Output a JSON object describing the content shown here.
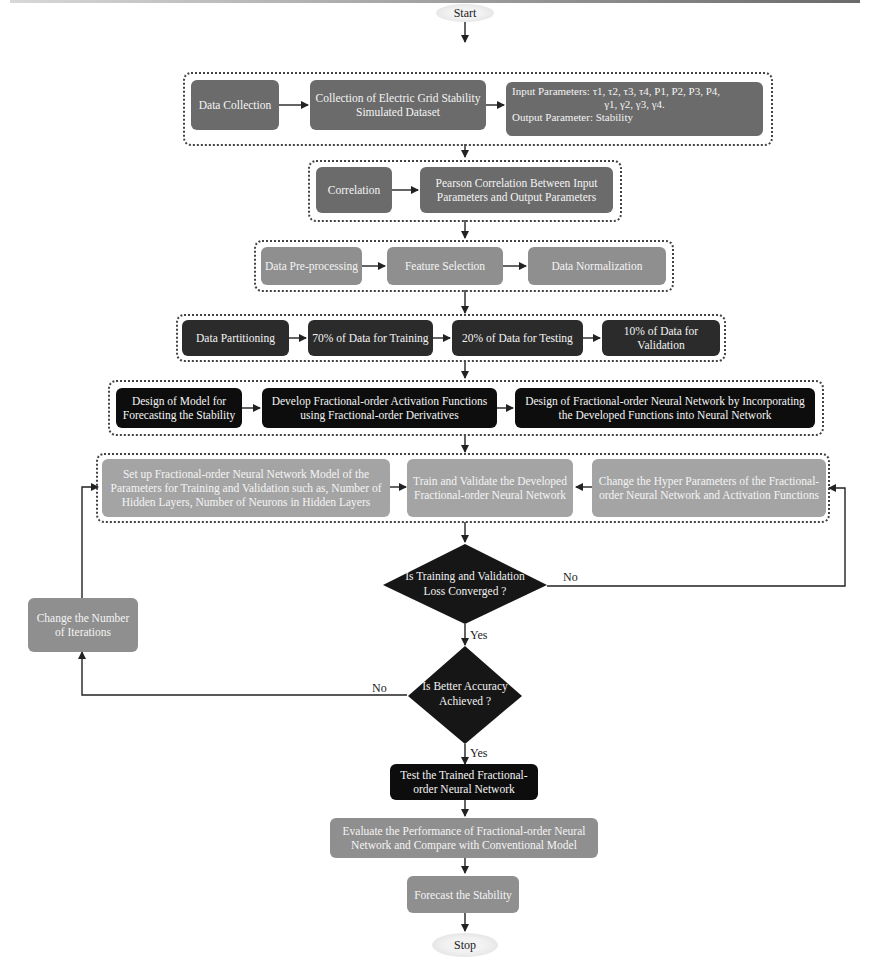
{
  "flowchart": {
    "start": "Start",
    "stop": "Stop",
    "groups": {
      "data_collection": {
        "nodes": [
          "Data Collection",
          "Collection of Electric Grid Stability Simulated Dataset"
        ],
        "params": {
          "input_line1": "Input Parameters: τ1, τ2, τ3, τ4, P1, P2, P3, P4,",
          "input_line2": "γ1, γ2, γ3, γ4.",
          "output_line": "Output Parameter: Stability"
        }
      },
      "correlation": {
        "nodes": [
          "Correlation",
          "Pearson Correlation Between Input Parameters and Output Parameters"
        ]
      },
      "preprocessing": {
        "nodes": [
          "Data Pre-processing",
          "Feature Selection",
          "Data Normalization"
        ]
      },
      "partitioning": {
        "nodes": [
          "Data Partitioning",
          "70% of Data for Training",
          "20% of Data for Testing",
          "10% of Data for Validation"
        ]
      },
      "design": {
        "nodes": [
          "Design of  Model  for Forecasting the Stability",
          "Develop Fractional-order Activation Functions using Fractional-order Derivatives",
          "Design of Fractional-order Neural Network by Incorporating the Developed Functions into Neural Network"
        ]
      },
      "training": {
        "nodes": [
          "Set up Fractional-order Neural Network Model  of the Parameters for Training and Validation such as, Number of Hidden Layers, Number of Neurons in Hidden Layers",
          "Train and Validate the Developed Fractional-order Neural Network",
          "Change the Hyper Parameters of the Fractional-order Neural Network and Activation Functions"
        ]
      }
    },
    "decisions": {
      "loss_converged": "Is Training and Validation Loss Converged ?",
      "better_accuracy": "Is Better Accuracy Achieved ?"
    },
    "edge_labels": {
      "yes": "Yes",
      "no": "No"
    },
    "side_nodes": {
      "change_iterations": "Change the Number of Iterations"
    },
    "final_nodes": [
      "Test the Trained Fractional-order Neural Network",
      "Evaluate the Performance of  Fractional-order Neural Network and Compare with Conventional Model",
      "Forecast the Stability"
    ]
  },
  "colors": {
    "mid_gray": "#6b6b6b",
    "light_gray": "#8f8f8f",
    "lighter_gray": "#a4a4a4",
    "dark_gray": "#2b2b2b",
    "black": "#0d0d0d"
  }
}
